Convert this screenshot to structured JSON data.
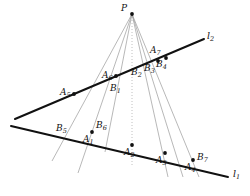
{
  "figure": {
    "width": 250,
    "height": 196,
    "background": "#ffffff",
    "ink_color": "#111111",
    "ray_color": "#9a9a9a",
    "dotted_ray_color": "#b0b0b0"
  },
  "chart_data": {
    "type": "diagram",
    "title": "",
    "xlabel": "",
    "ylabel": "",
    "xlim": [
      0,
      250
    ],
    "ylim": [
      0,
      196
    ],
    "grid": false,
    "legend": null,
    "center": {
      "name": "P",
      "label": "P",
      "x": 132,
      "y": 14
    },
    "lines": [
      {
        "name": "l1",
        "label": "l",
        "sub": "1",
        "x1": 11,
        "y1": 126,
        "x2": 228,
        "y2": 177,
        "label_x": 233,
        "label_y": 169,
        "width": 2.0
      },
      {
        "name": "l2",
        "label": "l",
        "sub": "2",
        "x1": 15,
        "y1": 119,
        "x2": 204,
        "y2": 39,
        "label_x": 207,
        "label_y": 31,
        "width": 2.0
      }
    ],
    "points": [
      {
        "name": "A1",
        "label": "A",
        "sub": "1",
        "x": 92,
        "y": 132,
        "on": "l1",
        "label_x": 83,
        "label_y": 135
      },
      {
        "name": "A2",
        "label": "A",
        "sub": "2",
        "x": 132,
        "y": 145,
        "on": "l1",
        "label_x": 124,
        "label_y": 148
      },
      {
        "name": "A3",
        "label": "A",
        "sub": "3",
        "x": 165,
        "y": 153,
        "on": "l1",
        "label_x": 156,
        "label_y": 156
      },
      {
        "name": "A4",
        "label": "A",
        "sub": "4",
        "x": 193,
        "y": 160,
        "on": "l1",
        "label_x": 185,
        "label_y": 163
      },
      {
        "name": "A5",
        "label": "A",
        "sub": "5",
        "x": 74,
        "y": 94,
        "on": "l2",
        "label_x": 60,
        "label_y": 88
      },
      {
        "name": "A6",
        "label": "A",
        "sub": "6",
        "x": 116,
        "y": 76,
        "on": "l2",
        "label_x": 102,
        "label_y": 71
      },
      {
        "name": "A7",
        "label": "A",
        "sub": "7",
        "x": 158,
        "y": 58,
        "on": "l2",
        "label_x": 150,
        "label_y": 46
      },
      {
        "name": "B1",
        "label": "B",
        "sub": "1",
        "x": 116,
        "y": 76,
        "on": "l2",
        "label_x": 110,
        "label_y": 84
      },
      {
        "name": "B2",
        "label": "B",
        "sub": "2",
        "x": 140,
        "y": 66,
        "on": "l2",
        "label_x": 131,
        "label_y": 68
      },
      {
        "name": "B3",
        "label": "B",
        "sub": "3",
        "x": 152,
        "y": 61,
        "on": "l2",
        "label_x": 144,
        "label_y": 64
      },
      {
        "name": "B4",
        "label": "B",
        "sub": "4",
        "x": 163,
        "y": 56,
        "on": "l2",
        "label_x": 156,
        "label_y": 60
      },
      {
        "name": "B5",
        "label": "B",
        "sub": "5",
        "x": 66,
        "y": 142,
        "on": "l1",
        "label_x": 56,
        "label_y": 124
      },
      {
        "name": "B6",
        "label": "B",
        "sub": "6",
        "x": 105,
        "y": 135,
        "on": "l1",
        "label_x": 96,
        "label_y": 121
      },
      {
        "name": "B7",
        "label": "B",
        "sub": "7",
        "x": 209,
        "y": 164,
        "on": "l1",
        "label_x": 197,
        "label_y": 153
      }
    ],
    "dots": [
      {
        "name": "P-dot",
        "x": 132,
        "y": 14
      },
      {
        "name": "A1-dot",
        "x": 92,
        "y": 132
      },
      {
        "name": "A2-dot",
        "x": 132,
        "y": 145
      },
      {
        "name": "A3-dot",
        "x": 165,
        "y": 153
      },
      {
        "name": "A4-dot",
        "x": 193,
        "y": 160
      },
      {
        "name": "A5-dot",
        "x": 74,
        "y": 94
      },
      {
        "name": "A6B1-dot",
        "x": 116,
        "y": 76
      },
      {
        "name": "A7-dot",
        "x": 158,
        "y": 61
      },
      {
        "name": "B4-dot",
        "x": 166,
        "y": 58
      }
    ],
    "rays": [
      {
        "name": "ray-P-A5",
        "x1": 132,
        "y1": 14,
        "x2": 52,
        "y2": 161,
        "style": "solid"
      },
      {
        "name": "ray-P-A1",
        "x1": 132,
        "y1": 14,
        "x2": 78,
        "y2": 173,
        "style": "solid"
      },
      {
        "name": "ray-P-B1",
        "x1": 132,
        "y1": 14,
        "x2": 105,
        "y2": 152,
        "style": "solid"
      },
      {
        "name": "ray-P-A2",
        "x1": 132,
        "y1": 14,
        "x2": 132,
        "y2": 166,
        "style": "dotted"
      },
      {
        "name": "ray-P-A3",
        "x1": 132,
        "y1": 14,
        "x2": 168,
        "y2": 177,
        "style": "solid"
      },
      {
        "name": "ray-P-A4",
        "x1": 132,
        "y1": 14,
        "x2": 183,
        "y2": 177,
        "style": "solid"
      },
      {
        "name": "ray-P-B7",
        "x1": 132,
        "y1": 14,
        "x2": 199,
        "y2": 177,
        "style": "solid"
      }
    ]
  }
}
